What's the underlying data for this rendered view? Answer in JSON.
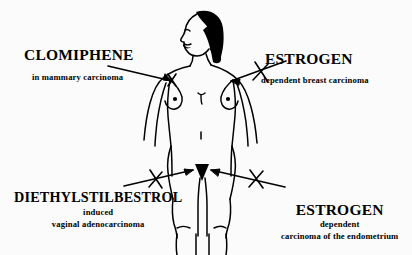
{
  "diagram": {
    "background_color": "#fbfbfb",
    "ink_color": "#000000",
    "figure": {
      "subject": "female-figure-front-view-with-profile-head",
      "description": "Line drawing of a nude female figure facing forward with head turned in left profile, long black hair, arms at sides, legs cropped at image bottom"
    },
    "annotations": [
      {
        "id": "clomiphene",
        "heading": "CLOMIPHENE",
        "caption": "in mammary carcinoma",
        "target": "left-breast",
        "marker": "x-mark",
        "arrow": "arrow-pointing-right-to-breast"
      },
      {
        "id": "estrogen-breast",
        "heading": "ESTROGEN",
        "caption": "dependent breast  carcinoma",
        "target": "right-breast",
        "marker": "x-mark",
        "arrow": "arrow-pointing-left-to-breast"
      },
      {
        "id": "diethylstilbestrol",
        "heading": "DIETHYLSTILBESTROL",
        "caption_line1": "induced",
        "caption_line2": "vaginal adenocarcinoma",
        "target": "pelvis-vagina",
        "marker": "x-mark",
        "arrow": "arrow-pointing-right-to-pelvis"
      },
      {
        "id": "estrogen-endometrium",
        "heading": "ESTROGEN",
        "caption_line1": "dependent",
        "caption_line2": "carcinoma of the endometrium",
        "target": "pelvis-endometrium",
        "marker": "x-mark",
        "arrow": "arrow-pointing-left-to-pelvis"
      }
    ]
  }
}
